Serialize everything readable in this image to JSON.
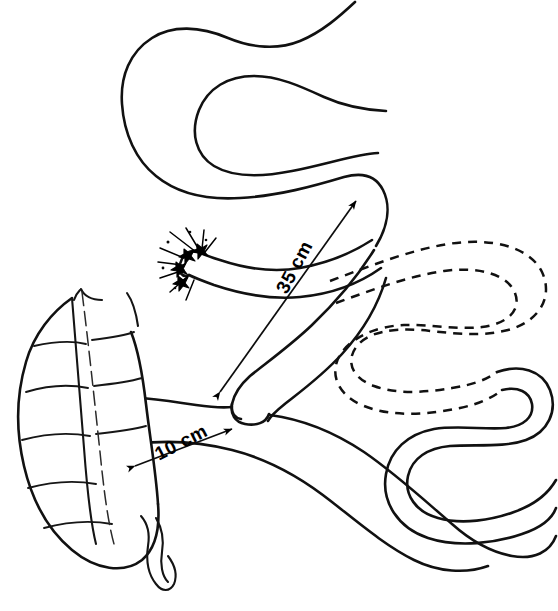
{
  "figure": {
    "type": "line-drawing",
    "background_color": "#ffffff",
    "ink_color": "#111111"
  },
  "measurements": [
    {
      "id": "roux-limb",
      "label": "35 cm",
      "arrow_style": "double-headed",
      "rotation_deg": -62
    },
    {
      "id": "common-channel",
      "label": "10 cm",
      "arrow_style": "double-headed",
      "rotation_deg": -27
    }
  ],
  "structures": {
    "proximal_jejunum": "in-continuity small bowel loop",
    "closed_stump": "sutured blind end",
    "bypassed_segment": "excluded bowel shown dashed",
    "cecum": "haustrated large bowel",
    "appendix": "vermiform appendix",
    "anastomosis": "end-to-side junction"
  }
}
